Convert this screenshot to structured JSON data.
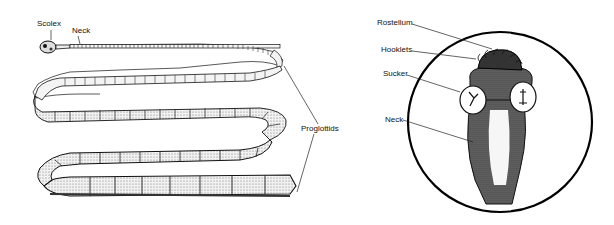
{
  "figure": {
    "left_panel": {
      "title": "Tapeworm whole body",
      "labels": {
        "scolex": "Scolex",
        "neck": "Neck",
        "proglottids": "Proglottids"
      }
    },
    "right_panel": {
      "title": "Scolex detail",
      "labels": {
        "rostellum": "Rostellum",
        "hooklets": "Hooklets",
        "sucker": "Sucker",
        "neck": "Neck"
      }
    }
  },
  "colors": {
    "ink": "#111111",
    "background": "#ffffff",
    "segment_fill": "#f4f4f4",
    "shade": "#555555"
  }
}
